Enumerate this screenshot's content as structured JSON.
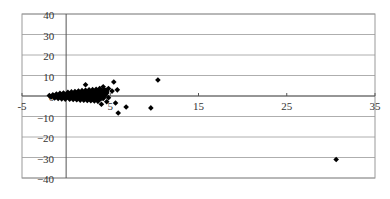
{
  "chart_data": {
    "type": "scatter",
    "title": "",
    "xlabel": "",
    "ylabel": "",
    "xlim": [
      -5,
      35
    ],
    "ylim": [
      -40,
      40
    ],
    "x_ticks": [
      -5,
      5,
      15,
      25,
      35
    ],
    "y_ticks": [
      40,
      30,
      20,
      10,
      0,
      -10,
      -20,
      -30,
      -40
    ],
    "x_tick_labels": [
      "-5",
      "5",
      "15",
      "25",
      "35"
    ],
    "y_tick_labels": [
      "40",
      "30",
      "20",
      "10",
      "0",
      "−10",
      "−20",
      "−30",
      "−40"
    ],
    "grid": {
      "horizontal": true,
      "vertical": false
    },
    "legend": null,
    "marker": "diamond",
    "marker_color": "#000000",
    "series": [
      {
        "name": "data",
        "points": [
          [
            5.4,
            6.8
          ],
          [
            5.8,
            3.0
          ],
          [
            5.6,
            -3.4
          ],
          [
            6.8,
            -5.4
          ],
          [
            5.9,
            -8.3
          ],
          [
            9.6,
            -5.8
          ],
          [
            10.4,
            7.8
          ],
          [
            30.6,
            -31.0
          ],
          [
            2.2,
            5.5
          ],
          [
            4.2,
            4.5
          ],
          [
            4.8,
            3.6
          ],
          [
            5.2,
            2.4
          ],
          [
            4.6,
            -2.8
          ],
          [
            4.0,
            -4.0
          ],
          [
            -1.9,
            0.2
          ],
          [
            -1.7,
            -0.5
          ],
          [
            -1.5,
            0.6
          ],
          [
            -1.3,
            -1.0
          ],
          [
            -1.1,
            1.0
          ],
          [
            -0.9,
            -1.2
          ],
          [
            -0.7,
            1.3
          ],
          [
            -0.5,
            -1.4
          ],
          [
            -0.3,
            1.5
          ],
          [
            -0.1,
            -1.5
          ],
          [
            0.0,
            0.0
          ],
          [
            0.2,
            1.8
          ],
          [
            0.4,
            -1.6
          ],
          [
            0.6,
            2.0
          ],
          [
            0.8,
            -1.7
          ],
          [
            1.0,
            2.2
          ],
          [
            1.2,
            -1.8
          ],
          [
            1.4,
            2.4
          ],
          [
            1.6,
            -2.0
          ],
          [
            1.8,
            2.6
          ],
          [
            2.0,
            -2.1
          ],
          [
            2.2,
            2.8
          ],
          [
            2.4,
            -2.2
          ],
          [
            2.6,
            3.0
          ],
          [
            2.8,
            -2.3
          ],
          [
            3.0,
            3.1
          ],
          [
            3.2,
            -2.4
          ],
          [
            3.4,
            3.3
          ],
          [
            3.6,
            -2.6
          ],
          [
            3.8,
            3.6
          ],
          [
            4.0,
            1.0
          ],
          [
            4.2,
            -1.2
          ],
          [
            4.4,
            0.5
          ],
          [
            4.6,
            2.0
          ],
          [
            4.8,
            -0.8
          ],
          [
            0.5,
            0.4
          ],
          [
            1.0,
            -0.3
          ],
          [
            1.5,
            0.8
          ],
          [
            2.0,
            0.2
          ],
          [
            2.5,
            1.2
          ],
          [
            3.0,
            -0.5
          ],
          [
            3.5,
            1.5
          ],
          [
            0.3,
            1.0
          ],
          [
            1.3,
            1.4
          ],
          [
            2.3,
            -1.0
          ],
          [
            3.3,
            0.8
          ],
          [
            -0.8,
            0.3
          ],
          [
            0.8,
            -0.8
          ],
          [
            1.8,
            0.9
          ],
          [
            2.8,
            0.4
          ]
        ]
      }
    ]
  }
}
